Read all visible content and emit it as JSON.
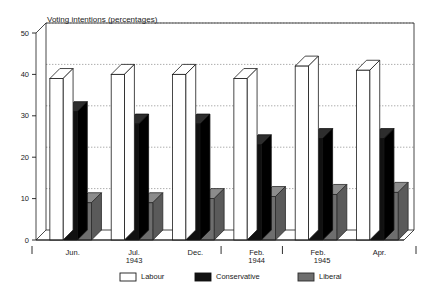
{
  "chart_data": {
    "type": "bar",
    "title": "Voting intentions (percentages)",
    "xlabel": "",
    "ylabel": "",
    "ylim": [
      0,
      50
    ],
    "yticks": [
      0,
      10,
      20,
      30,
      40,
      50
    ],
    "ytick_labels": [
      "0",
      "10",
      "20",
      "30",
      "40",
      "50"
    ],
    "grid": true,
    "grid_style": "dotted-horizontal",
    "legend_position": "bottom-center",
    "orientation": "vertical",
    "style": "3d-blocks",
    "categories": [
      "Jun.",
      "Jul.",
      "Dec.",
      "Feb.",
      "Feb.",
      "Apr."
    ],
    "period_labels": [
      "1943",
      "1944",
      "1945"
    ],
    "series": [
      {
        "name": "Labour",
        "color": "#ffffff",
        "edge_color": "#1a1a1a",
        "values": [
          39,
          40,
          40,
          39,
          42,
          41
        ]
      },
      {
        "name": "Conservative",
        "color": "#111111",
        "edge_color": "#111111",
        "values": [
          31,
          28,
          28,
          23,
          24.5,
          24.5
        ]
      },
      {
        "name": "Liberal",
        "color": "#6e6e6e",
        "edge_color": "#2a2a2a",
        "values": [
          9,
          9,
          10,
          10.5,
          11,
          11.5
        ]
      }
    ]
  },
  "chart": {
    "title": "Voting intentions (percentages)"
  },
  "legend": {
    "items": [
      {
        "label": "Labour",
        "swatch": "labour-swatch"
      },
      {
        "label": "Conservative",
        "swatch": "conservative-swatch"
      },
      {
        "label": "Liberal",
        "swatch": "liberal-swatch"
      }
    ]
  },
  "axes": {
    "y_ticks": [
      "50",
      "40",
      "30",
      "20",
      "10",
      "0"
    ],
    "x_groups": [
      {
        "label": "Jun.",
        "year": ""
      },
      {
        "label": "Jul.",
        "year": "1943"
      },
      {
        "label": "Dec.",
        "year": ""
      },
      {
        "label": "Feb.",
        "year": "1944"
      },
      {
        "label": "Feb.",
        "year": ""
      },
      {
        "label": "Apr.",
        "year": ""
      }
    ],
    "year_markers": [
      "1943",
      "1944",
      "1945"
    ]
  },
  "colors": {
    "labour": "#ffffff",
    "conservative": "#111111",
    "liberal": "#6e6e6e",
    "axis": "#1a1a1a",
    "grid": "#8a8a8a",
    "background": "#ffffff"
  }
}
